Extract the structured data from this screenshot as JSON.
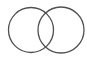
{
  "diagram": {
    "type": "venn",
    "background": "#ffffff",
    "stroke_color": "#505050",
    "stroke_width": 1.3,
    "circles": [
      {
        "id": "left",
        "cx": 31,
        "cy": 30,
        "r": 22.5
      },
      {
        "id": "right",
        "cx": 61,
        "cy": 30,
        "r": 23
      }
    ]
  }
}
